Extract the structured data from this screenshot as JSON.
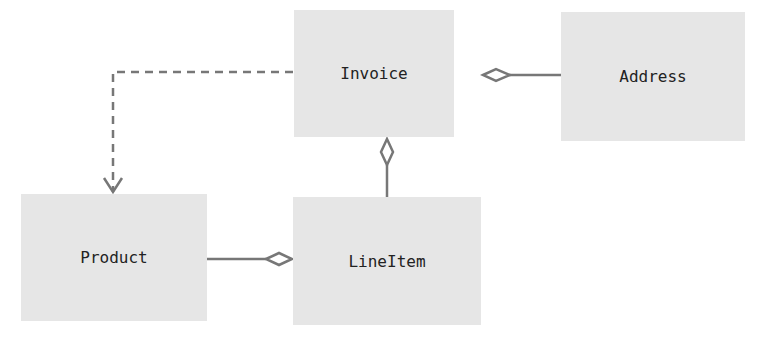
{
  "diagram": {
    "type": "uml-class-diagram",
    "nodes": [
      {
        "id": "invoice",
        "label": "Invoice"
      },
      {
        "id": "address",
        "label": "Address"
      },
      {
        "id": "product",
        "label": "Product"
      },
      {
        "id": "lineitem",
        "label": "LineItem"
      }
    ],
    "edges": [
      {
        "from": "invoice",
        "to": "product",
        "kind": "dependency",
        "style": "dashed",
        "head": "open-arrow"
      },
      {
        "from": "address",
        "to": "invoice",
        "kind": "aggregation",
        "head": "hollow-diamond"
      },
      {
        "from": "lineitem",
        "to": "invoice",
        "kind": "aggregation",
        "head": "hollow-diamond"
      },
      {
        "from": "product",
        "to": "lineitem",
        "kind": "aggregation",
        "head": "hollow-diamond"
      }
    ],
    "colors": {
      "box": "#e6e6e6",
      "line": "#777777",
      "text": "#222222"
    }
  }
}
